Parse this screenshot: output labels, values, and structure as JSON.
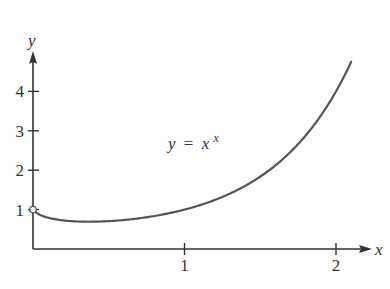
{
  "chart_data": {
    "type": "line",
    "title": "",
    "annotation": {
      "lhs": "y",
      "eq": "=",
      "base": "x",
      "exp": "x",
      "text": "y = x^x"
    },
    "xlabel": "x",
    "ylabel": "y",
    "xlim": [
      0,
      2.15
    ],
    "ylim": [
      0,
      5.2
    ],
    "x_ticks": [
      1,
      2
    ],
    "x_tick_labels": [
      "1",
      "2"
    ],
    "y_ticks": [
      1,
      2,
      3,
      4
    ],
    "y_tick_labels": [
      "1",
      "2",
      "3",
      "4"
    ],
    "grid": false,
    "legend": null,
    "function": "x^x",
    "open_point": {
      "x": 0,
      "y": 1
    },
    "series": [
      {
        "name": "y = x^x",
        "x": [
          0,
          0.1,
          0.2,
          0.3,
          0.368,
          0.5,
          0.6,
          0.7,
          0.8,
          0.9,
          1.0,
          1.2,
          1.4,
          1.6,
          1.8,
          2.0,
          2.1
        ],
        "values": [
          1.0,
          0.79,
          0.72,
          0.7,
          0.69,
          0.71,
          0.74,
          0.78,
          0.84,
          0.91,
          1.0,
          1.24,
          1.6,
          2.12,
          2.88,
          4.0,
          4.76
        ]
      }
    ],
    "colors": {
      "axis": "#333333",
      "curve": "#555555",
      "background": "#ffffff"
    }
  }
}
